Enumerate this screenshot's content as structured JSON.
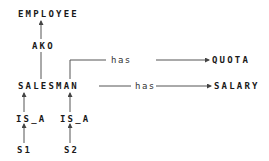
{
  "diagram": {
    "nodes": {
      "employee": "EMPLOYEE",
      "ako": "AKO",
      "salesman": "SALESMAN",
      "quota": "QUOTA",
      "salary": "SALARY",
      "is_a_1": "IS_A",
      "is_a_2": "IS_A",
      "s1": "S1",
      "s2": "S2"
    },
    "edges": {
      "has_quota": "has",
      "has_salary": "has"
    },
    "colors": {
      "line": "#555555",
      "text": "#1a1a1a",
      "background": "#ffffff"
    }
  }
}
